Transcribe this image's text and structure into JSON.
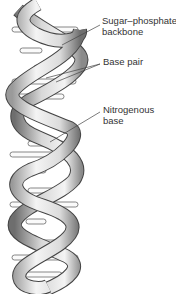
{
  "diagram": {
    "type": "dna-double-helix",
    "labels": [
      {
        "id": "sugar",
        "line1": "Sugar–phosphate",
        "line2": "backbone"
      },
      {
        "id": "basepair",
        "line1": "Base pair",
        "line2": ""
      },
      {
        "id": "nitro",
        "line1": "Nitrogenous",
        "line2": "base"
      }
    ],
    "base_pairs": [
      {
        "y": 30,
        "text": "G  C"
      },
      {
        "y": 82,
        "text": "A  T"
      },
      {
        "y": 96,
        "text": "G  C"
      },
      {
        "y": 144,
        "text": "G  C"
      },
      {
        "y": 155,
        "text": "T  A"
      },
      {
        "y": 190,
        "text": "G  C"
      },
      {
        "y": 205,
        "text": "T  A"
      },
      {
        "y": 243,
        "text": "G  C"
      },
      {
        "y": 258,
        "text": "T  A"
      },
      {
        "y": 275,
        "text": "A  T"
      }
    ],
    "colors": {
      "ribbon_light": "#f2f2f2",
      "ribbon_dark": "#7a7a7a",
      "outline": "#444444",
      "text": "#333333"
    }
  }
}
